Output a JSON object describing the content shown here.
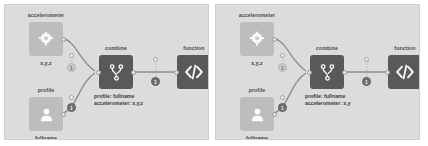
{
  "meta": {
    "view": "node-graph-editor",
    "panel_count": 2,
    "colors": {
      "page_background": "#ffffff",
      "panel_background": "#dcdcdc",
      "node_dark": "#595959",
      "node_light": "#bdbdbd",
      "edge": "#8f8f8f",
      "text": "#3a3a3a"
    }
  },
  "panels": [
    {
      "id": "panel-left",
      "nodes": {
        "accelerometer": {
          "title": "accelerometer",
          "sub": "x,y,z",
          "icon": "accelerometer-icon"
        },
        "profile": {
          "title": "profile",
          "sub": "fullname",
          "icon": "person-icon"
        },
        "combine": {
          "title": "combine",
          "icon": "merge-icon"
        },
        "function": {
          "title": "function",
          "icon": "code-icon"
        }
      },
      "combine_output": {
        "line1": "profile: fullname",
        "line2": "accelerometer: x,y,z"
      },
      "badges": [
        {
          "name": "badge-accelerometer-edge",
          "label": "1"
        },
        {
          "name": "badge-profile-edge",
          "label": "1"
        },
        {
          "name": "badge-combine-function-edge",
          "label": "1"
        }
      ]
    },
    {
      "id": "panel-right",
      "nodes": {
        "accelerometer": {
          "title": "accelerometer",
          "sub": "x,y,z",
          "icon": "accelerometer-icon"
        },
        "profile": {
          "title": "profile",
          "sub": "fullname",
          "icon": "person-icon"
        },
        "combine": {
          "title": "combine",
          "icon": "merge-icon"
        },
        "function": {
          "title": "function",
          "icon": "code-icon"
        }
      },
      "combine_output": {
        "line1": "profile: fullname",
        "line2": "accelerometer: x,y"
      },
      "badges": [
        {
          "name": "badge-accelerometer-edge",
          "label": "1"
        },
        {
          "name": "badge-profile-edge",
          "label": "1"
        },
        {
          "name": "badge-combine-function-edge",
          "label": "1"
        }
      ]
    }
  ]
}
